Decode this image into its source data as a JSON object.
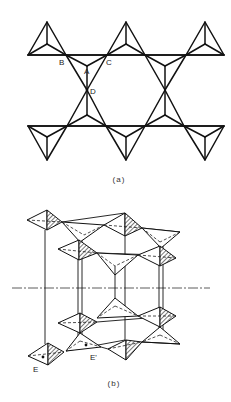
{
  "figure": {
    "panel_a": {
      "caption": "(a)",
      "vertex_labels": {
        "B": "B",
        "A": "A",
        "C": "C",
        "D": "D"
      },
      "description": "Plan view of corner-sharing tetrahedra layer forming hexagonal rings"
    },
    "panel_b": {
      "caption": "(b)",
      "vertex_labels": {
        "E": "E",
        "E_prime": "E'"
      },
      "description": "Perspective view of stacked tetrahedral layers with hatched shaded faces and dash-dot symmetry axis"
    },
    "colors": {
      "line": "#111111",
      "background": "#ffffff"
    }
  }
}
